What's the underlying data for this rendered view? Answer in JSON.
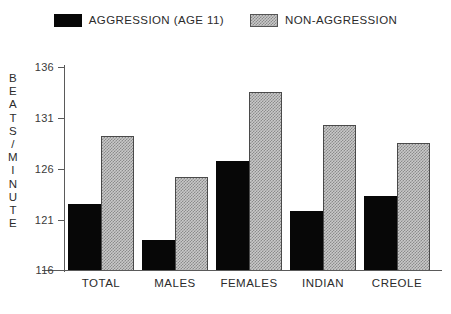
{
  "legend": {
    "entries": [
      {
        "label": "AGGRESSION (AGE 11)",
        "swatch": "solid-black-swatch",
        "color": "#070707"
      },
      {
        "label": "NON-AGGRESSION",
        "swatch": "hatched-gray-swatch",
        "color": "#c9c9c9"
      }
    ]
  },
  "axis": {
    "y_title_chars": [
      "B",
      "E",
      "A",
      "T",
      "S",
      "/",
      "M",
      "I",
      "N",
      "U",
      "T",
      "E"
    ],
    "y_title": "BEATS / MINUTE",
    "y_ticks": [
      "136",
      "131",
      "126",
      "121",
      "116"
    ]
  },
  "chart_data": {
    "type": "bar",
    "title": "",
    "xlabel": "",
    "ylabel": "BEATS / MINUTE",
    "ylim": [
      116,
      136
    ],
    "yticks": [
      116,
      121,
      126,
      131,
      136
    ],
    "grid": false,
    "legend_position": "top-center",
    "categories": [
      "TOTAL",
      "MALES",
      "FEMALES",
      "INDIAN",
      "CREOLE"
    ],
    "series": [
      {
        "name": "AGGRESSION (AGE 11)",
        "values": [
          122.5,
          119.0,
          126.7,
          121.8,
          123.3
        ]
      },
      {
        "name": "NON-AGGRESSION",
        "values": [
          129.2,
          125.2,
          133.5,
          130.3,
          128.5
        ]
      }
    ]
  }
}
